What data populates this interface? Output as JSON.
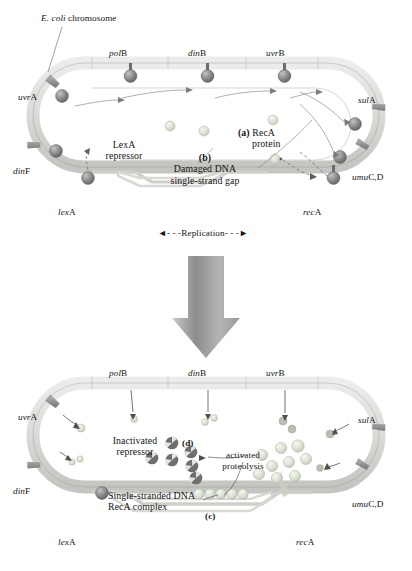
{
  "figure": {
    "title_note": "E. coli SOS response — LexA repressor cleavage by RecA",
    "top_panel_caption": "E. coli chromosome",
    "replication_label": "Replication",
    "arrow_direction": "down"
  },
  "colors": {
    "chromosome_light": "#d9d9d4",
    "chromosome_band": "#8f9190",
    "chromosome_band_dark": "#6e7270",
    "lexa_sphere": "#8c8c8c",
    "reca_sphere_pale": "#dfe4d8",
    "reca_sphere_mid": "#c9cfc0",
    "fragment": "#6f6f6f",
    "arrow_gray": "#a6a6a6",
    "outline": "#707070",
    "text": "#141414"
  },
  "panels": [
    {
      "id": "panel-top",
      "name": "uninduced-sos-state",
      "genes_top": [
        "polB",
        "dinB",
        "uvrB"
      ],
      "genes_left": [
        "uvrA",
        "dinF",
        "lexA"
      ],
      "genes_right": [
        "sulA",
        "umuC,D",
        "recA"
      ],
      "gene_labels": [
        {
          "italic": "pol",
          "roman": "B"
        },
        {
          "italic": "din",
          "roman": "B"
        },
        {
          "italic": "uvr",
          "roman": "B"
        },
        {
          "italic": "uvr",
          "roman": "A"
        },
        {
          "italic": "din",
          "roman": "F"
        },
        {
          "italic": "lex",
          "roman": "A"
        },
        {
          "italic": "sul",
          "roman": "A"
        },
        {
          "italic": "umu",
          "roman": "C,D"
        },
        {
          "italic": "rec",
          "roman": "A"
        }
      ],
      "annotations": [
        {
          "key": "chromosome",
          "text": "E. coli chromosome",
          "italic_part": "E. coli",
          "roman_part": "chromosome"
        },
        {
          "key": "lexa",
          "line1": "LexA",
          "line2": "repressor"
        },
        {
          "key": "b",
          "tag": "(b)",
          "line1": "Damaged DNA",
          "line2": "single-strand gap"
        },
        {
          "key": "a",
          "tag": "(a)",
          "line1": "RecA",
          "line2": "protein"
        },
        {
          "key": "replication",
          "text": "Replication"
        }
      ]
    },
    {
      "id": "panel-bottom",
      "name": "induced-sos-state",
      "gene_labels": [
        {
          "italic": "pol",
          "roman": "B"
        },
        {
          "italic": "din",
          "roman": "B"
        },
        {
          "italic": "uvr",
          "roman": "B"
        },
        {
          "italic": "uvr",
          "roman": "A"
        },
        {
          "italic": "din",
          "roman": "F"
        },
        {
          "italic": "lex",
          "roman": "A"
        },
        {
          "italic": "sul",
          "roman": "A"
        },
        {
          "italic": "umu",
          "roman": "C,D"
        },
        {
          "italic": "rec",
          "roman": "A"
        }
      ],
      "annotations": [
        {
          "key": "inactivated",
          "line1": "Inactivated",
          "line2": "repressor"
        },
        {
          "key": "d",
          "tag": "(d)"
        },
        {
          "key": "proteolysis",
          "line1": "activated",
          "line2": "proteolysis"
        },
        {
          "key": "ssdna",
          "line1": "Single-stranded DNA",
          "line2": "RecA complex"
        },
        {
          "key": "c",
          "tag": "(c)"
        }
      ]
    }
  ],
  "labels": {
    "ecoli_italic": "E. coli",
    "ecoli_roman": "chromosome",
    "polB_i": "pol",
    "polB_r": "B",
    "dinB_i": "din",
    "dinB_r": "B",
    "uvrB_i": "uvr",
    "uvrB_r": "B",
    "uvrA_i": "uvr",
    "uvrA_r": "A",
    "dinF_i": "din",
    "dinF_r": "F",
    "lexA_i": "lex",
    "lexA_r": "A",
    "sulA_i": "sul",
    "sulA_r": "A",
    "umuCD_i": "umu",
    "umuCD_r": "C,D",
    "recA_i": "rec",
    "recA_r": "A",
    "lexa_l1": "LexA",
    "lexa_l2": "repressor",
    "tag_a": "(a)",
    "reca_l1": "RecA",
    "reca_l2": "protein",
    "tag_b": "(b)",
    "damaged_l1": "Damaged DNA",
    "damaged_l2": "single-strand gap",
    "replication": "Replication",
    "replication_arrows_left": "◄- - -",
    "replication_arrows_right": "- - -►",
    "inactivated_l1": "Inactivated",
    "inactivated_l2": "repressor",
    "tag_d": "(d)",
    "proteolysis_l1": "activated",
    "proteolysis_l2": "proteolysis",
    "ssdna_l1": "Single-stranded DNA",
    "ssdna_l2": "RecA complex",
    "tag_c": "(c)"
  }
}
